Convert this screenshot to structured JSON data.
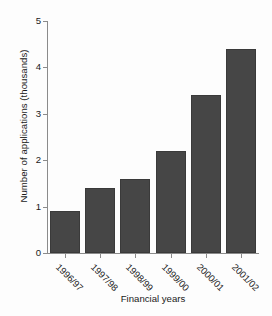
{
  "chart_data": {
    "type": "bar",
    "title": "",
    "subtitle": "",
    "xlabel": "Financial years",
    "ylabel": "Number of applications (thousands)",
    "categories": [
      "1996/97",
      "1997/98",
      "1998/99",
      "1999/00",
      "2000/01",
      "2001/02"
    ],
    "values": [
      0.9,
      1.4,
      1.6,
      2.2,
      3.4,
      4.4
    ],
    "ylim": [
      0,
      5
    ],
    "yticks": [
      0,
      1,
      2,
      3,
      4,
      5
    ],
    "ytick_labels": [
      "0",
      "1",
      "2",
      "3",
      "4",
      "5"
    ],
    "grid": false,
    "legend": null,
    "annotations": [],
    "bar_color": "#464646",
    "axis_color": "#8b8b8b",
    "background_color": "#fdfdfd",
    "text_color": "#1a1a1a"
  }
}
